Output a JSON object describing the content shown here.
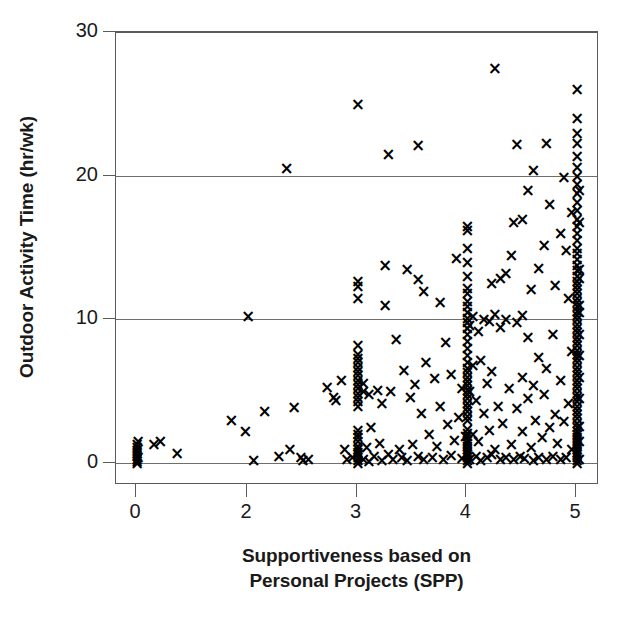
{
  "chart_data": {
    "type": "scatter",
    "title": "",
    "xlabel": "Supportiveness based on Personal Projects (SPP)",
    "ylabel": "Outdoor Activity Time (hr/wk)",
    "xlabel_line1": "Supportiveness based on",
    "xlabel_line2": "Personal Projects (SPP)",
    "xlim": [
      -0.18,
      5.2
    ],
    "ylim": [
      -0.9,
      30.5
    ],
    "xticks": [
      0,
      2,
      3,
      4,
      5
    ],
    "xtick_labels": [
      "0",
      "2",
      "3",
      "4",
      "5"
    ],
    "yticks": [
      0,
      10,
      20,
      30
    ],
    "ytick_labels": [
      "0",
      "10",
      "20",
      "30"
    ],
    "grid": "horizontal",
    "gridlines_y": [
      0,
      10,
      20,
      30
    ],
    "legend": "none",
    "marker": "x",
    "marker_color": "#000000",
    "axis_color": "#5a5a5a",
    "grid_color": "#6e6e6e",
    "background": "#ffffff",
    "n_points": 318,
    "points": [
      [
        0.0,
        0.0
      ],
      [
        0.0,
        0.15
      ],
      [
        0.0,
        0.3
      ],
      [
        0.0,
        0.5
      ],
      [
        0.0,
        0.7
      ],
      [
        0.0,
        0.9
      ],
      [
        0.0,
        1.1
      ],
      [
        0.0,
        1.35
      ],
      [
        0.02,
        0.45
      ],
      [
        0.02,
        1.5
      ],
      [
        0.3,
        1.3
      ],
      [
        0.42,
        1.5
      ],
      [
        0.72,
        0.7
      ],
      [
        1.7,
        3.0
      ],
      [
        1.95,
        2.2
      ],
      [
        2.0,
        10.2
      ],
      [
        2.05,
        0.2
      ],
      [
        2.15,
        3.6
      ],
      [
        2.28,
        0.5
      ],
      [
        2.35,
        20.5
      ],
      [
        2.38,
        1.0
      ],
      [
        2.42,
        3.9
      ],
      [
        2.48,
        0.4
      ],
      [
        2.5,
        0.2
      ],
      [
        2.55,
        0.3
      ],
      [
        2.72,
        5.3
      ],
      [
        2.78,
        4.6
      ],
      [
        2.8,
        4.4
      ],
      [
        2.85,
        5.8
      ],
      [
        2.88,
        1.0
      ],
      [
        2.9,
        0.3
      ],
      [
        2.95,
        0.45
      ],
      [
        3.0,
        0.0
      ],
      [
        3.0,
        0.2
      ],
      [
        3.0,
        0.4
      ],
      [
        3.0,
        0.6
      ],
      [
        3.0,
        0.8
      ],
      [
        3.0,
        1.0
      ],
      [
        3.0,
        1.2
      ],
      [
        3.0,
        1.5
      ],
      [
        3.0,
        1.8
      ],
      [
        3.0,
        2.0
      ],
      [
        3.0,
        2.3
      ],
      [
        3.0,
        4.0
      ],
      [
        3.0,
        4.3
      ],
      [
        3.0,
        4.6
      ],
      [
        3.0,
        4.9
      ],
      [
        3.0,
        5.2
      ],
      [
        3.0,
        5.5
      ],
      [
        3.0,
        5.8
      ],
      [
        3.0,
        6.1
      ],
      [
        3.0,
        6.4
      ],
      [
        3.0,
        6.7
      ],
      [
        3.0,
        7.0
      ],
      [
        3.0,
        7.3
      ],
      [
        3.0,
        7.6
      ],
      [
        3.0,
        8.2
      ],
      [
        3.0,
        11.5
      ],
      [
        3.0,
        12.3
      ],
      [
        3.0,
        12.7
      ],
      [
        3.0,
        25.0
      ],
      [
        3.05,
        0.3
      ],
      [
        3.05,
        5.0
      ],
      [
        3.05,
        5.6
      ],
      [
        3.08,
        1.1
      ],
      [
        3.1,
        0.15
      ],
      [
        3.1,
        4.8
      ],
      [
        3.12,
        2.5
      ],
      [
        3.15,
        0.5
      ],
      [
        3.18,
        5.1
      ],
      [
        3.2,
        1.4
      ],
      [
        3.22,
        0.2
      ],
      [
        3.22,
        4.2
      ],
      [
        3.25,
        11.0
      ],
      [
        3.25,
        13.8
      ],
      [
        3.28,
        0.6
      ],
      [
        3.3,
        5.0
      ],
      [
        3.32,
        0.3
      ],
      [
        3.35,
        8.6
      ],
      [
        3.38,
        1.0
      ],
      [
        3.4,
        0.4
      ],
      [
        3.42,
        6.5
      ],
      [
        3.45,
        0.2
      ],
      [
        3.45,
        13.5
      ],
      [
        3.48,
        4.6
      ],
      [
        3.5,
        1.3
      ],
      [
        3.52,
        5.5
      ],
      [
        3.55,
        0.5
      ],
      [
        3.55,
        12.8
      ],
      [
        3.58,
        3.5
      ],
      [
        3.6,
        0.25
      ],
      [
        3.62,
        7.0
      ],
      [
        3.65,
        2.0
      ],
      [
        3.68,
        0.45
      ],
      [
        3.7,
        5.9
      ],
      [
        3.72,
        1.2
      ],
      [
        3.75,
        4.0
      ],
      [
        3.78,
        0.3
      ],
      [
        3.8,
        8.4
      ],
      [
        3.82,
        2.7
      ],
      [
        3.85,
        0.55
      ],
      [
        3.85,
        6.2
      ],
      [
        3.88,
        1.6
      ],
      [
        3.9,
        14.3
      ],
      [
        3.92,
        3.2
      ],
      [
        3.95,
        0.35
      ],
      [
        3.95,
        5.2
      ],
      [
        3.98,
        1.9
      ],
      [
        3.28,
        21.5
      ],
      [
        3.55,
        22.1
      ],
      [
        3.6,
        12.0
      ],
      [
        3.75,
        11.2
      ],
      [
        4.0,
        0.0
      ],
      [
        4.0,
        0.2
      ],
      [
        4.0,
        0.4
      ],
      [
        4.0,
        0.6
      ],
      [
        4.0,
        0.8
      ],
      [
        4.0,
        1.0
      ],
      [
        4.0,
        1.2
      ],
      [
        4.0,
        1.4
      ],
      [
        4.0,
        1.6
      ],
      [
        4.0,
        1.9
      ],
      [
        4.0,
        2.1
      ],
      [
        4.0,
        2.4
      ],
      [
        4.0,
        3.0
      ],
      [
        4.0,
        3.3
      ],
      [
        4.0,
        3.6
      ],
      [
        4.0,
        3.9
      ],
      [
        4.0,
        4.2
      ],
      [
        4.0,
        4.5
      ],
      [
        4.0,
        4.8
      ],
      [
        4.0,
        5.1
      ],
      [
        4.0,
        5.4
      ],
      [
        4.0,
        5.7
      ],
      [
        4.0,
        6.0
      ],
      [
        4.0,
        6.3
      ],
      [
        4.0,
        6.6
      ],
      [
        4.0,
        7.0
      ],
      [
        4.0,
        7.5
      ],
      [
        4.0,
        8.0
      ],
      [
        4.0,
        8.5
      ],
      [
        4.0,
        9.0
      ],
      [
        4.0,
        9.4
      ],
      [
        4.0,
        9.8
      ],
      [
        4.0,
        10.1
      ],
      [
        4.0,
        10.5
      ],
      [
        4.0,
        10.9
      ],
      [
        4.0,
        11.3
      ],
      [
        4.0,
        11.8
      ],
      [
        4.0,
        12.2
      ],
      [
        4.0,
        13.0
      ],
      [
        4.0,
        14.0
      ],
      [
        4.0,
        15.0
      ],
      [
        4.0,
        16.2
      ],
      [
        4.0,
        16.5
      ],
      [
        4.02,
        0.3
      ],
      [
        4.02,
        5.0
      ],
      [
        4.02,
        9.6
      ],
      [
        4.05,
        2.0
      ],
      [
        4.05,
        6.8
      ],
      [
        4.05,
        10.2
      ],
      [
        4.08,
        0.5
      ],
      [
        4.08,
        4.4
      ],
      [
        4.1,
        1.5
      ],
      [
        4.1,
        9.2
      ],
      [
        4.12,
        0.2
      ],
      [
        4.12,
        7.2
      ],
      [
        4.15,
        3.5
      ],
      [
        4.15,
        10.0
      ],
      [
        4.18,
        0.4
      ],
      [
        4.18,
        5.6
      ],
      [
        4.2,
        2.3
      ],
      [
        4.2,
        9.9
      ],
      [
        4.22,
        0.6
      ],
      [
        4.22,
        6.4
      ],
      [
        4.25,
        1.0
      ],
      [
        4.25,
        10.4
      ],
      [
        4.25,
        27.5
      ],
      [
        4.28,
        4.0
      ],
      [
        4.3,
        0.3
      ],
      [
        4.3,
        9.5
      ],
      [
        4.32,
        2.8
      ],
      [
        4.35,
        0.45
      ],
      [
        4.35,
        10.0
      ],
      [
        4.38,
        5.2
      ],
      [
        4.4,
        1.3
      ],
      [
        4.4,
        14.5
      ],
      [
        4.42,
        0.25
      ],
      [
        4.45,
        3.8
      ],
      [
        4.45,
        9.8
      ],
      [
        4.48,
        0.5
      ],
      [
        4.5,
        2.2
      ],
      [
        4.5,
        6.0
      ],
      [
        4.5,
        10.3
      ],
      [
        4.52,
        0.35
      ],
      [
        4.55,
        4.5
      ],
      [
        4.55,
        8.8
      ],
      [
        4.58,
        1.1
      ],
      [
        4.6,
        0.2
      ],
      [
        4.6,
        5.4
      ],
      [
        4.62,
        3.0
      ],
      [
        4.65,
        0.4
      ],
      [
        4.65,
        7.4
      ],
      [
        4.68,
        1.8
      ],
      [
        4.7,
        4.8
      ],
      [
        4.72,
        0.3
      ],
      [
        4.72,
        6.6
      ],
      [
        4.75,
        2.5
      ],
      [
        4.78,
        0.5
      ],
      [
        4.78,
        9.0
      ],
      [
        4.8,
        3.4
      ],
      [
        4.82,
        1.4
      ],
      [
        4.85,
        0.25
      ],
      [
        4.85,
        5.8
      ],
      [
        4.88,
        2.9
      ],
      [
        4.9,
        0.4
      ],
      [
        4.92,
        4.2
      ],
      [
        4.95,
        1.0
      ],
      [
        4.95,
        7.8
      ],
      [
        4.22,
        12.5
      ],
      [
        4.3,
        12.9
      ],
      [
        4.35,
        13.2
      ],
      [
        4.42,
        16.8
      ],
      [
        4.45,
        22.2
      ],
      [
        4.5,
        17.0
      ],
      [
        4.55,
        19.0
      ],
      [
        4.58,
        12.1
      ],
      [
        4.6,
        20.4
      ],
      [
        4.65,
        13.6
      ],
      [
        4.7,
        15.2
      ],
      [
        4.72,
        22.3
      ],
      [
        4.75,
        18.0
      ],
      [
        4.8,
        12.4
      ],
      [
        4.85,
        16.0
      ],
      [
        4.88,
        19.9
      ],
      [
        4.9,
        14.8
      ],
      [
        4.92,
        11.5
      ],
      [
        4.95,
        17.5
      ],
      [
        5.0,
        0.0
      ],
      [
        5.0,
        0.2
      ],
      [
        5.0,
        0.4
      ],
      [
        5.0,
        0.6
      ],
      [
        5.0,
        0.8
      ],
      [
        5.0,
        1.0
      ],
      [
        5.0,
        1.2
      ],
      [
        5.0,
        1.4
      ],
      [
        5.0,
        1.6
      ],
      [
        5.0,
        1.8
      ],
      [
        5.0,
        2.0
      ],
      [
        5.0,
        2.2
      ],
      [
        5.0,
        2.5
      ],
      [
        5.0,
        2.8
      ],
      [
        5.0,
        3.1
      ],
      [
        5.0,
        3.4
      ],
      [
        5.0,
        3.7
      ],
      [
        5.0,
        4.0
      ],
      [
        5.0,
        4.3
      ],
      [
        5.0,
        4.6
      ],
      [
        5.0,
        4.9
      ],
      [
        5.0,
        5.2
      ],
      [
        5.0,
        5.5
      ],
      [
        5.0,
        5.8
      ],
      [
        5.0,
        6.1
      ],
      [
        5.0,
        6.4
      ],
      [
        5.0,
        6.7
      ],
      [
        5.0,
        7.0
      ],
      [
        5.0,
        7.3
      ],
      [
        5.0,
        7.6
      ],
      [
        5.0,
        7.9
      ],
      [
        5.0,
        8.2
      ],
      [
        5.0,
        8.5
      ],
      [
        5.0,
        8.8
      ],
      [
        5.0,
        9.1
      ],
      [
        5.0,
        9.4
      ],
      [
        5.0,
        9.7
      ],
      [
        5.0,
        10.0
      ],
      [
        5.0,
        10.3
      ],
      [
        5.0,
        10.6
      ],
      [
        5.0,
        10.9
      ],
      [
        5.0,
        11.2
      ],
      [
        5.0,
        11.5
      ],
      [
        5.0,
        11.8
      ],
      [
        5.0,
        12.1
      ],
      [
        5.0,
        12.4
      ],
      [
        5.0,
        12.7
      ],
      [
        5.0,
        13.0
      ],
      [
        5.0,
        13.4
      ],
      [
        5.0,
        13.8
      ],
      [
        5.0,
        14.2
      ],
      [
        5.0,
        14.6
      ],
      [
        5.0,
        15.0
      ],
      [
        5.0,
        15.5
      ],
      [
        5.0,
        16.0
      ],
      [
        5.0,
        16.5
      ],
      [
        5.0,
        17.0
      ],
      [
        5.0,
        17.6
      ],
      [
        5.0,
        18.2
      ],
      [
        5.0,
        18.8
      ],
      [
        5.0,
        19.4
      ],
      [
        5.0,
        20.0
      ],
      [
        5.0,
        20.6
      ],
      [
        5.0,
        21.4
      ],
      [
        5.0,
        22.3
      ],
      [
        5.0,
        23.0
      ],
      [
        5.0,
        24.0
      ],
      [
        5.0,
        26.0
      ],
      [
        5.02,
        0.3
      ],
      [
        5.02,
        2.6
      ],
      [
        5.02,
        6.0
      ],
      [
        5.02,
        9.0
      ],
      [
        5.02,
        11.0
      ],
      [
        5.02,
        12.9
      ],
      [
        5.02,
        1.5
      ],
      [
        5.02,
        4.5
      ],
      [
        5.02,
        7.5
      ],
      [
        5.02,
        10.5
      ],
      [
        5.02,
        13.5
      ],
      [
        5.02,
        16.8
      ],
      [
        5.02,
        19.0
      ]
    ]
  },
  "axis": {
    "ylabel": "Outdoor Activity Time (hr/wk)",
    "xlabel_line1": "Supportiveness based on",
    "xlabel_line2": "Personal Projects (SPP)"
  }
}
